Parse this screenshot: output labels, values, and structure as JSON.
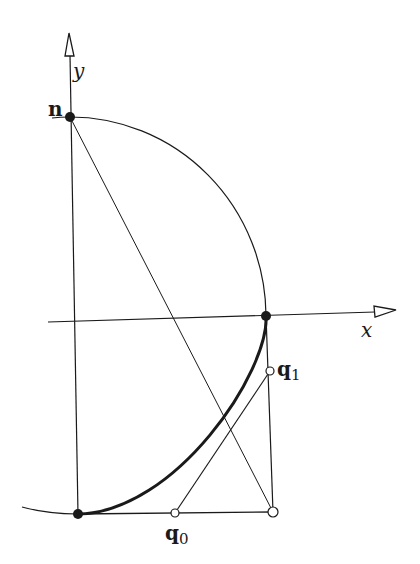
{
  "diagram": {
    "type": "geometric-construction",
    "colors": {
      "ink": "#1a1a1a",
      "background": "#ffffff"
    },
    "axes": {
      "x": {
        "label": "x"
      },
      "y": {
        "label": "y"
      }
    },
    "points": {
      "n": {
        "label": "n",
        "style": "filled"
      },
      "q1": {
        "label": "q",
        "subscript": "1",
        "style": "open"
      },
      "q0": {
        "label": "q",
        "subscript": "0",
        "style": "open"
      },
      "axis_intersection": {
        "style": "filled"
      },
      "bottom_left": {
        "style": "filled"
      },
      "bottom_right": {
        "style": "open"
      }
    },
    "curves": [
      {
        "name": "circle-arc",
        "description": "quarter circle from n to x-axis point",
        "weight": "thin"
      },
      {
        "name": "bezier-curve",
        "description": "thick curve from bottom-left to x-axis point",
        "weight": "thick"
      },
      {
        "name": "lower-circle-arc",
        "description": "arc through bottom-left point",
        "weight": "thin"
      }
    ]
  }
}
